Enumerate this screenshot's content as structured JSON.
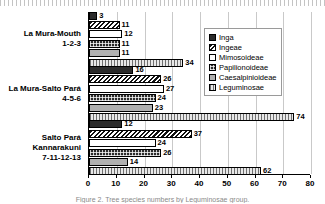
{
  "chart_data": {
    "type": "bar",
    "orientation": "horizontal",
    "title": "",
    "xlabel": "",
    "ylabel": "",
    "xlim": [
      0,
      80
    ],
    "xticks": [
      0,
      10,
      20,
      30,
      40,
      50,
      60,
      70,
      80
    ],
    "grid": true,
    "legend_position": "upper right",
    "categories": [
      "La Mura-Mouth\n1-2-3",
      "La Mura-Salto Pará\n4-5-6",
      "Salto Pará\nKannarakuni\n7-11-12-13"
    ],
    "category_lines": [
      [
        "La Mura-Mouth",
        "1-2-3"
      ],
      [
        "La Mura-Salto Pará",
        "4-5-6"
      ],
      [
        "Salto Pará",
        "Kannarakuni",
        "7-11-12-13"
      ]
    ],
    "series": [
      {
        "name": "Inga",
        "pattern": "solid-black",
        "values": [
          3,
          16,
          12
        ]
      },
      {
        "name": "Ingeae",
        "pattern": "diagonal-hatch",
        "values": [
          11,
          26,
          37
        ]
      },
      {
        "name": "Mimosoideae",
        "pattern": "white-empty",
        "values": [
          12,
          27,
          24
        ]
      },
      {
        "name": "Papilionoideae",
        "pattern": "dark-crosshatch",
        "values": [
          11,
          24,
          26
        ]
      },
      {
        "name": "Caesalpinioideae",
        "pattern": "light-gray",
        "values": [
          11,
          23,
          14
        ]
      },
      {
        "name": "Leguminosae",
        "pattern": "vertical-stripes",
        "values": [
          34,
          74,
          62
        ]
      }
    ]
  },
  "caption": "Figure 2.  Tree species numbers by Leguminosae group."
}
